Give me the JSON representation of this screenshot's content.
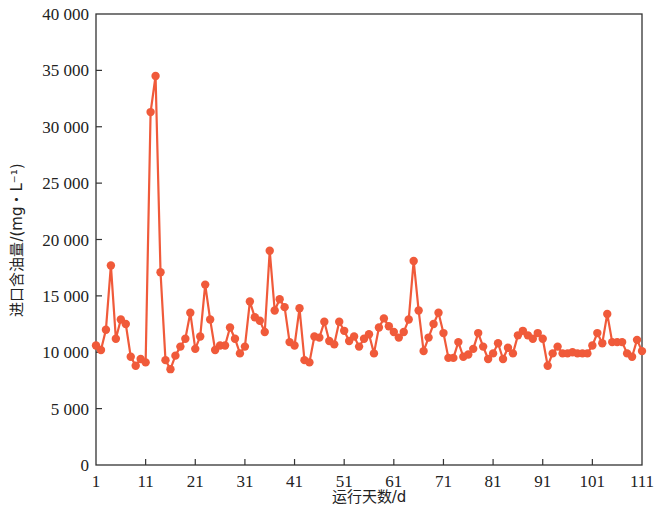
{
  "chart_data": {
    "type": "line",
    "title": "",
    "xlabel": "运行天数/d",
    "ylabel": "进口含油量/(mg・L⁻¹)",
    "xlim": [
      1,
      111
    ],
    "ylim": [
      0,
      40000
    ],
    "x_ticks": [
      1,
      11,
      21,
      31,
      41,
      51,
      61,
      71,
      81,
      91,
      101,
      111
    ],
    "y_ticks": [
      0,
      5000,
      10000,
      15000,
      20000,
      25000,
      30000,
      35000,
      40000
    ],
    "y_tick_labels": [
      "0",
      "5 000",
      "10 000",
      "15 000",
      "20 000",
      "25 000",
      "30 000",
      "35 000",
      "40 000"
    ],
    "grid": false,
    "legend": null,
    "marker": "circle",
    "color": "#f05a3a",
    "series": [
      {
        "name": "进口含油量",
        "x": [
          1,
          2,
          3,
          4,
          5,
          6,
          7,
          8,
          9,
          10,
          11,
          12,
          13,
          14,
          15,
          16,
          17,
          18,
          19,
          20,
          21,
          22,
          23,
          24,
          25,
          26,
          27,
          28,
          29,
          30,
          31,
          32,
          33,
          34,
          35,
          36,
          37,
          38,
          39,
          40,
          41,
          42,
          43,
          44,
          45,
          46,
          47,
          48,
          49,
          50,
          51,
          52,
          53,
          54,
          55,
          56,
          57,
          58,
          59,
          60,
          61,
          62,
          63,
          64,
          65,
          66,
          67,
          68,
          69,
          70,
          71,
          72,
          73,
          74,
          75,
          76,
          77,
          78,
          79,
          80,
          81,
          82,
          83,
          84,
          85,
          86,
          87,
          88,
          89,
          90,
          91,
          92,
          93,
          94,
          95,
          96,
          97,
          98,
          99,
          100,
          101,
          102,
          103,
          104,
          105,
          106,
          107,
          108,
          109,
          110,
          111
        ],
        "values": [
          10600,
          10200,
          12000,
          17700,
          11200,
          12900,
          12500,
          9600,
          8800,
          9400,
          9100,
          31300,
          34500,
          17100,
          9300,
          8500,
          9700,
          10500,
          11200,
          13500,
          10300,
          11400,
          16000,
          12900,
          10200,
          10600,
          10600,
          12200,
          11200,
          9900,
          10500,
          14500,
          13100,
          12800,
          11800,
          19000,
          13700,
          14700,
          14000,
          10900,
          10600,
          13900,
          9300,
          9100,
          11400,
          11300,
          12700,
          11000,
          10700,
          12700,
          11900,
          11000,
          11400,
          10500,
          11200,
          11600,
          9900,
          12200,
          13000,
          12300,
          11800,
          11300,
          11800,
          12900,
          18100,
          13700,
          10100,
          11300,
          12500,
          13500,
          11700,
          9500,
          9500,
          10900,
          9600,
          9800,
          10300,
          11700,
          10500,
          9400,
          9900,
          10800,
          9400,
          10400,
          9900,
          11500,
          11900,
          11500,
          11200,
          11700,
          11200,
          8800,
          9900,
          10500,
          9900,
          9900,
          10000,
          9900,
          9900,
          9900,
          10600,
          11700,
          10800,
          13400,
          10900,
          10900,
          10900,
          9900,
          9600,
          11100,
          10100
        ]
      }
    ]
  },
  "axes": {
    "xlabel": "运行天数/d",
    "ylabel": "进口含油量/(mg・L⁻¹)"
  }
}
